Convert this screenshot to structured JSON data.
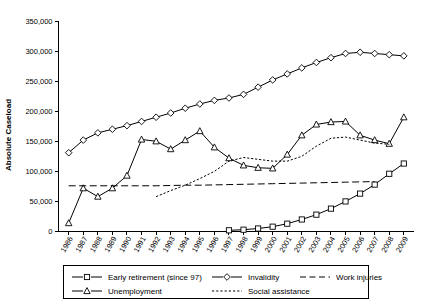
{
  "chart_data": {
    "type": "line",
    "title": "",
    "xlabel": "",
    "ylabel": "Absolute Caseload",
    "ylim": [
      0,
      350000
    ],
    "ytick_labels": [
      "0",
      "50,000",
      "100,000",
      "150,000",
      "200,000",
      "250,000",
      "300,000",
      "350,000"
    ],
    "ytick_values": [
      0,
      50000,
      100000,
      150000,
      200000,
      250000,
      300000,
      350000
    ],
    "grid": false,
    "legend_position": "bottom",
    "categories": [
      "1986",
      "1987",
      "1988",
      "1989",
      "1990",
      "1991",
      "1992",
      "1993",
      "1994",
      "1995",
      "1996",
      "1997",
      "1998",
      "1999",
      "2000",
      "2001",
      "2002",
      "2003",
      "2004",
      "2005",
      "2006",
      "2007",
      "2008",
      "2009"
    ],
    "series": [
      {
        "name": "Early retirement (since 97)",
        "marker": "square",
        "line_style": "solid",
        "values": [
          null,
          null,
          null,
          null,
          null,
          null,
          null,
          null,
          null,
          null,
          null,
          2000,
          3000,
          5000,
          8000,
          13000,
          20000,
          28000,
          38000,
          50000,
          63000,
          78000,
          96000,
          113000
        ]
      },
      {
        "name": "Invalidity",
        "marker": "diamond",
        "line_style": "solid",
        "values": [
          131000,
          152000,
          164000,
          170000,
          176000,
          183000,
          190000,
          197000,
          205000,
          212000,
          218000,
          222000,
          228000,
          240000,
          252000,
          262000,
          272000,
          281000,
          289000,
          296000,
          298000,
          296000,
          294000,
          292000
        ]
      },
      {
        "name": "Unemployment",
        "marker": "triangle",
        "line_style": "solid",
        "values": [
          14000,
          72000,
          58000,
          72000,
          93000,
          153000,
          150000,
          137000,
          152000,
          167000,
          140000,
          122000,
          110000,
          106000,
          105000,
          128000,
          160000,
          178000,
          182000,
          183000,
          160000,
          152000,
          146000,
          190000
        ]
      },
      {
        "name": "Work injuries",
        "marker": "none",
        "line_style": "longdash",
        "values": [
          76000,
          76000,
          76000,
          76000,
          76000,
          76000,
          76000,
          76500,
          77000,
          77000,
          77500,
          78000,
          78500,
          79000,
          79500,
          80000,
          80500,
          81000,
          81500,
          82000,
          82500,
          83000,
          null,
          null
        ]
      },
      {
        "name": "Social assistance",
        "marker": "none",
        "line_style": "dotted",
        "values": [
          null,
          null,
          null,
          null,
          null,
          null,
          58000,
          68000,
          77000,
          88000,
          100000,
          117000,
          123000,
          120000,
          117000,
          117000,
          125000,
          142000,
          155000,
          157000,
          152000,
          147000,
          145000,
          null
        ]
      }
    ]
  },
  "legend": {
    "entries": [
      {
        "label": "Early retirement (since 97)",
        "style": "solid-square"
      },
      {
        "label": "Invalidity",
        "style": "solid-diamond"
      },
      {
        "label": "Work injuries",
        "style": "longdash"
      },
      {
        "label": "Unemployment",
        "style": "solid-triangle"
      },
      {
        "label": "Social assistance",
        "style": "dotted"
      }
    ]
  },
  "colors": {
    "line": "#000000",
    "background": "#ffffff",
    "axis": "#000000"
  }
}
